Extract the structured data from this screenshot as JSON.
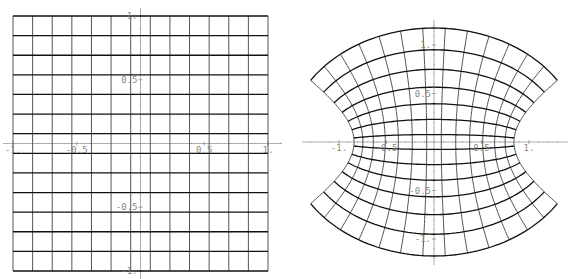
{
  "figure": {
    "caption_cut": "",
    "colors": {
      "horizontal_lines": "#111111",
      "vertical_lines": "#555555",
      "axes": "#999999",
      "tick_labels": "#888888",
      "background": "#ffffff"
    }
  },
  "left_plot": {
    "title": "",
    "description": "Square grid on [-1,1] x [-1,1] (domain)",
    "grid_divisions": 13,
    "x_range": [
      -1,
      1
    ],
    "y_range": [
      -1,
      1
    ],
    "x_ticks": [
      {
        "value": -1,
        "label": "-1."
      },
      {
        "value": -0.5,
        "label": "-0.5"
      },
      {
        "value": 0.5,
        "label": "0.5"
      },
      {
        "value": 1,
        "label": "1."
      }
    ],
    "y_ticks": [
      {
        "value": 1,
        "label": "1."
      },
      {
        "value": 0.5,
        "label": "0.5"
      },
      {
        "value": -0.5,
        "label": "-0.5"
      },
      {
        "value": -1,
        "label": "-1."
      }
    ]
  },
  "right_plot": {
    "title": "",
    "description": "Image of the grid under w = sin(z)",
    "mapping": "sin",
    "x_ticks": [
      {
        "value": -1,
        "label": "-1."
      },
      {
        "value": -0.5,
        "label": "-0.5"
      },
      {
        "value": 0.5,
        "label": "0.5"
      },
      {
        "value": 1,
        "label": "1."
      }
    ],
    "y_ticks": [
      {
        "value": 1,
        "label": "1."
      },
      {
        "value": 0.5,
        "label": "0.5"
      },
      {
        "value": -0.5,
        "label": "-0.5"
      },
      {
        "value": -1,
        "label": "-1."
      }
    ]
  },
  "chart_data": [
    {
      "type": "line",
      "title": "Domain grid",
      "xlabel": "",
      "ylabel": "",
      "xlim": [
        -1,
        1
      ],
      "ylim": [
        -1,
        1
      ],
      "grid_lines_x": [
        -1,
        -0.846,
        -0.692,
        -0.538,
        -0.385,
        -0.231,
        -0.077,
        0.077,
        0.231,
        0.385,
        0.538,
        0.692,
        0.846,
        1
      ],
      "grid_lines_y": [
        -1,
        -0.846,
        -0.692,
        -0.538,
        -0.385,
        -0.231,
        -0.077,
        0.077,
        0.231,
        0.385,
        0.538,
        0.692,
        0.846,
        1
      ],
      "x_tick_labels": [
        "-1.",
        "-0.5",
        "0.5",
        "1."
      ],
      "y_tick_labels": [
        "1.",
        "0.5",
        "-0.5",
        "-1."
      ]
    },
    {
      "type": "line",
      "title": "Image under sin(z)",
      "xlabel": "",
      "ylabel": "",
      "xlim": [
        -1.4,
        1.4
      ],
      "ylim": [
        -1.4,
        1.4
      ],
      "key_points": {
        "top_center": [
          0,
          1.175
        ],
        "bottom_center": [
          0,
          -1.175
        ],
        "corner_top_right": [
          1.298,
          0.635
        ],
        "corner_top_left": [
          -1.298,
          0.635
        ],
        "waist_right": [
          0.841,
          0
        ],
        "waist_left": [
          -0.841,
          0
        ]
      },
      "x_tick_labels": [
        "-1.",
        "-0.5",
        "0.5",
        "1."
      ],
      "y_tick_labels": [
        "1.",
        "0.5",
        "-0.5",
        "-1."
      ]
    }
  ]
}
